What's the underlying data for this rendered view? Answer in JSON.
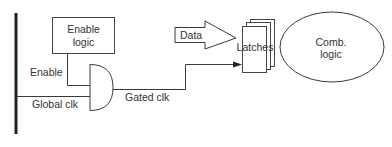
{
  "diagram": {
    "title": "",
    "blocks": {
      "enable_logic": {
        "line1": "Enable",
        "line2": "logic"
      },
      "latches": {
        "label": "Latches"
      },
      "comb_logic": {
        "line1": "Comb.",
        "line2": "logic"
      },
      "data_arrow": {
        "label": "Data"
      }
    },
    "signals": {
      "enable": "Enable",
      "global_clk": "Global clk",
      "gated_clk": "Gated clk"
    },
    "colors": {
      "line": "#3a3a3a",
      "text": "#333333",
      "background": "#ffffff"
    }
  }
}
